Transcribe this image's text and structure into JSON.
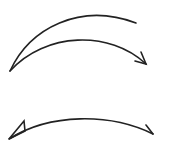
{
  "diagram": {
    "stroke_color": "#222222",
    "arrows": [
      {
        "id": "arc-top-open",
        "description": "upper arc from lower-left to upper-right, no arrowhead"
      },
      {
        "id": "arc-top-arrow",
        "description": "arc from lower-left to right ending in arrowhead"
      },
      {
        "id": "arc-bottom-double",
        "description": "shallow arc with arrowheads on both ends"
      }
    ],
    "caption_cut": ""
  }
}
